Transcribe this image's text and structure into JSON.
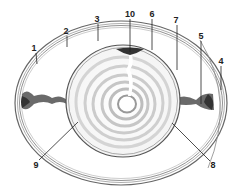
{
  "diagram": {
    "colors": {
      "background": "#ffffff",
      "outline": "#555555",
      "yolk_ring_light": "#f2f2f2",
      "yolk_ring_dark": "#d2d2d2",
      "chalaza": "#444444",
      "leader": "#222222"
    },
    "labels": [
      {
        "id": "1",
        "text": "1",
        "x": 34,
        "y": 48
      },
      {
        "id": "2",
        "text": "2",
        "x": 66,
        "y": 31
      },
      {
        "id": "3",
        "text": "3",
        "x": 97,
        "y": 19
      },
      {
        "id": "10",
        "text": "10",
        "x": 130,
        "y": 14
      },
      {
        "id": "6",
        "text": "6",
        "x": 152,
        "y": 14
      },
      {
        "id": "7",
        "text": "7",
        "x": 176,
        "y": 20
      },
      {
        "id": "5",
        "text": "5",
        "x": 201,
        "y": 36
      },
      {
        "id": "4",
        "text": "4",
        "x": 221,
        "y": 61
      },
      {
        "id": "9",
        "text": "9",
        "x": 36,
        "y": 165
      },
      {
        "id": "8",
        "text": "8",
        "x": 213,
        "y": 165
      }
    ]
  }
}
